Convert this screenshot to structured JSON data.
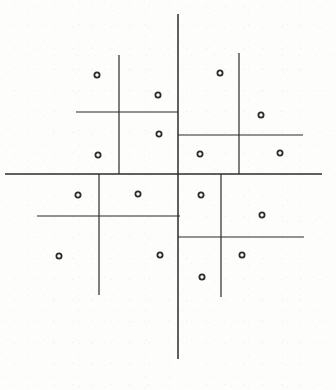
{
  "figure": {
    "background_color": "#fdfdfc",
    "ink_color": "#2b2b2b",
    "width": 336,
    "height": 390
  },
  "chart_data": {
    "type": "scatter",
    "title": "",
    "subtitle": "",
    "xlabel": "",
    "ylabel": "",
    "xlim": [
      0,
      336
    ],
    "ylim": [
      0,
      390
    ],
    "grid": false,
    "legend": null,
    "axes_visible": false,
    "tick_labels_x": [],
    "tick_labels_y": [],
    "point_marker": "open-circle",
    "point_radius": 2.6,
    "point_color": "#2b2b2b",
    "points": [
      {
        "id": "p1",
        "x": 97,
        "y": 75
      },
      {
        "id": "p2",
        "x": 158,
        "y": 95
      },
      {
        "id": "p3",
        "x": 220,
        "y": 73
      },
      {
        "id": "p4",
        "x": 261,
        "y": 115
      },
      {
        "id": "p5",
        "x": 159,
        "y": 134
      },
      {
        "id": "p6",
        "x": 98,
        "y": 155
      },
      {
        "id": "p7",
        "x": 200,
        "y": 154
      },
      {
        "id": "p8",
        "x": 280,
        "y": 153
      },
      {
        "id": "p9",
        "x": 78,
        "y": 195
      },
      {
        "id": "p10",
        "x": 138,
        "y": 194
      },
      {
        "id": "p11",
        "x": 201,
        "y": 195
      },
      {
        "id": "p12",
        "x": 262,
        "y": 215
      },
      {
        "id": "p13",
        "x": 59,
        "y": 256
      },
      {
        "id": "p14",
        "x": 160,
        "y": 255
      },
      {
        "id": "p15",
        "x": 242,
        "y": 255
      },
      {
        "id": "p16",
        "x": 202,
        "y": 277
      }
    ],
    "partition_lines": [
      {
        "id": "root-vertical",
        "orientation": "vertical",
        "x": 178,
        "y1": 14,
        "y2": 359,
        "level": 0,
        "width": 1.5
      },
      {
        "id": "root-horizontal",
        "orientation": "horizontal",
        "y": 174,
        "x1": 5,
        "x2": 322,
        "level": 0,
        "width": 1.5
      },
      {
        "id": "tl-vertical",
        "orientation": "vertical",
        "x": 119,
        "y1": 55,
        "y2": 174,
        "level": 1,
        "width": 1.2
      },
      {
        "id": "tl-horizontal",
        "orientation": "horizontal",
        "y": 112,
        "x1": 76,
        "x2": 178,
        "level": 2,
        "width": 1.2
      },
      {
        "id": "tr-vertical",
        "orientation": "vertical",
        "x": 239,
        "y1": 53,
        "y2": 174,
        "level": 1,
        "width": 1.2
      },
      {
        "id": "tr-horizontal",
        "orientation": "horizontal",
        "y": 135,
        "x1": 178,
        "x2": 303,
        "level": 2,
        "width": 1.2
      },
      {
        "id": "bl-vertical",
        "orientation": "vertical",
        "x": 99,
        "y1": 174,
        "y2": 295,
        "level": 1,
        "width": 1.2
      },
      {
        "id": "bl-horizontal",
        "orientation": "horizontal",
        "y": 216,
        "x1": 37,
        "x2": 180,
        "level": 2,
        "width": 1.2
      },
      {
        "id": "br-vertical",
        "orientation": "vertical",
        "x": 221,
        "y1": 174,
        "y2": 297,
        "level": 1,
        "width": 1.2
      },
      {
        "id": "br-horizontal",
        "orientation": "horizontal",
        "y": 237,
        "x1": 178,
        "x2": 304,
        "level": 2,
        "width": 1.2
      }
    ]
  }
}
